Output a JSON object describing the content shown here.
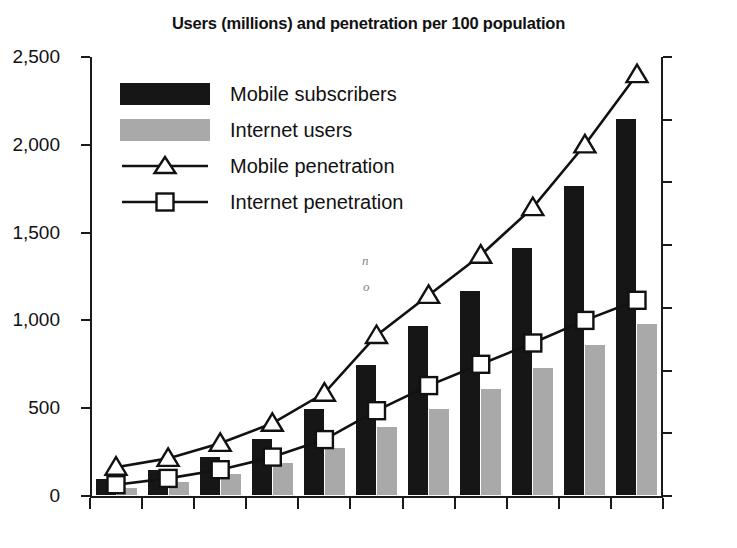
{
  "chart_data": {
    "type": "bar",
    "title": "Users (millions) and penetration per 100 population",
    "subtitle": "",
    "xlabel": "",
    "ylabel": "",
    "y2label": "",
    "grid": false,
    "legend_position": "upper-left",
    "categories": [
      "95",
      "96",
      "97",
      "98",
      "99",
      "2000",
      "01",
      "02",
      "03",
      "04",
      "05"
    ],
    "ylim": [
      0,
      2500
    ],
    "y_ticks": [
      "0",
      "500",
      "1,000",
      "1,500",
      "2,000",
      "2,500"
    ],
    "y_tick_values": [
      0,
      500,
      1000,
      1500,
      2000,
      2500
    ],
    "y2lim": [
      0,
      35
    ],
    "y2_ticks": [
      "0",
      "5",
      "10",
      "15",
      "20",
      "25",
      "30",
      "35"
    ],
    "y2_tick_values": [
      0,
      5,
      10,
      15,
      20,
      25,
      30,
      35
    ],
    "series": [
      {
        "name": "Mobile subscribers",
        "kind": "bar",
        "axis": "left",
        "color": "#161616",
        "values": [
          91,
          145,
          215,
          318,
          490,
          740,
          960,
          1160,
          1405,
          1760,
          2140
        ]
      },
      {
        "name": "Internet users",
        "kind": "bar",
        "axis": "left",
        "color": "#a9a9a9",
        "values": [
          40,
          75,
          120,
          180,
          265,
          390,
          490,
          605,
          725,
          855,
          975
        ]
      },
      {
        "name": "Mobile penetration",
        "kind": "line",
        "axis": "right",
        "marker": "triangle",
        "color": "#111111",
        "values": [
          2.3,
          3.0,
          4.2,
          5.8,
          8.2,
          12.8,
          16.0,
          19.2,
          23.0,
          28.0,
          33.6
        ]
      },
      {
        "name": "Internet penetration",
        "kind": "line",
        "axis": "right",
        "marker": "square",
        "color": "#111111",
        "values": [
          0.9,
          1.4,
          2.1,
          3.1,
          4.5,
          6.8,
          8.8,
          10.5,
          12.2,
          14.0,
          15.6
        ]
      }
    ],
    "annotations": [
      {
        "text": "n",
        "note": "faint scan artifact inside 2000 mobile bar"
      },
      {
        "text": "o",
        "note": "faint scan artifact inside 2000 mobile bar"
      }
    ]
  },
  "legend": {
    "items": [
      {
        "label": "Mobile subscribers",
        "icon": "black-bar-swatch"
      },
      {
        "label": "Internet users",
        "icon": "gray-bar-swatch"
      },
      {
        "label": "Mobile penetration",
        "icon": "line-triangle-marker"
      },
      {
        "label": "Internet penetration",
        "icon": "line-square-marker"
      }
    ]
  },
  "colors": {
    "mobile_bar": "#161616",
    "internet_bar": "#a9a9a9",
    "line": "#111111",
    "axis": "#1a1a1a",
    "background": "#ffffff"
  }
}
